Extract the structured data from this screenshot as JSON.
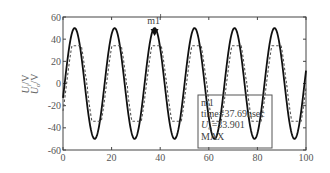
{
  "chart_data": {
    "type": "line",
    "title": "",
    "xlabel": "",
    "ylabel": "U_i/V",
    "xlim": [
      0,
      100
    ],
    "ylim": [
      -60,
      60
    ],
    "xticks": [
      0,
      20,
      40,
      60,
      80,
      100
    ],
    "yticks": [
      60,
      40,
      20,
      0,
      -20,
      -40,
      -60
    ],
    "grid": false,
    "legend": null,
    "series": [
      {
        "name": "sine (solid)",
        "style": "solid",
        "color": "#111111",
        "amplitude": 50,
        "period": 16.45,
        "phase_peak_x": 4.8,
        "peaks_x": [
          4.8,
          21.2,
          37.7,
          54.1,
          70.6,
          87.0
        ],
        "troughs_x": [
          13.0,
          29.4,
          45.9,
          62.3,
          78.8,
          95.2
        ]
      },
      {
        "name": "clipped wave (dashed)",
        "style": "dashed",
        "color": "#555555",
        "clip_level": 34,
        "approx_levels": [
          34,
          -34
        ]
      }
    ],
    "marker": {
      "label": "m1",
      "x": 37.69,
      "y": 50,
      "symbol": "filled-down-triangle"
    },
    "annotation": {
      "lines": [
        "m1",
        "time=37.69nsec",
        "U_o=33.901",
        "MAX"
      ]
    }
  },
  "axis": {
    "ylabel_line1": "U",
    "ylabel_sub1": "i",
    "ylabel_suffix": "/V",
    "ylabel_line2": "U",
    "ylabel_sub2": "o",
    "ylabel_suffix2": "/V"
  },
  "annotation_box": {
    "line1": "m1",
    "line2": "time=37.69nsec",
    "line3_var": "U",
    "line3_sub": "o",
    "line3_val": "=33.901",
    "line4": "MAX"
  },
  "marker_label": "m1"
}
